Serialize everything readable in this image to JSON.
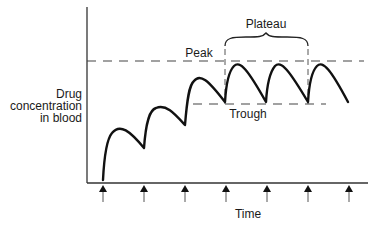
{
  "diagram": {
    "y_axis_label_lines": [
      "Drug",
      "concentration",
      "in blood"
    ],
    "x_axis_label": "Time",
    "annotations": {
      "peak": "Peak",
      "trough": "Trough",
      "plateau": "Plateau"
    },
    "dose_arrows_count": 7,
    "colors": {
      "curve": "#111111",
      "axis": "#333333",
      "dashed": "#444444",
      "background": "#ffffff"
    }
  }
}
